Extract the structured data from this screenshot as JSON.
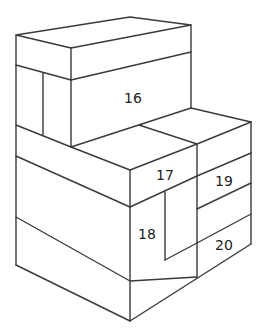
{
  "diagram": {
    "type": "isometric-block-stack",
    "line_color": "#3a3a3a",
    "background": "#ffffff",
    "labels": [
      {
        "id": "16",
        "text": "16",
        "x": 133,
        "y": 103
      },
      {
        "id": "17",
        "text": "17",
        "x": 165,
        "y": 180
      },
      {
        "id": "18",
        "text": "18",
        "x": 147,
        "y": 239
      },
      {
        "id": "19",
        "text": "19",
        "x": 224,
        "y": 186
      },
      {
        "id": "20",
        "text": "20",
        "x": 224,
        "y": 250
      }
    ]
  }
}
